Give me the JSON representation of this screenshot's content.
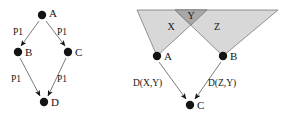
{
  "figure": {
    "background_color": "#ffffff",
    "ink_color": "#141414",
    "edge_stroke_color": "#6b6b6b",
    "region_fill_light": "#d8d8d8",
    "region_fill_dark": "#a8a8a8",
    "region_stroke": "#7a7a7a"
  },
  "left_diagram": {
    "name": "diamond-dependency-graph",
    "nodes": [
      {
        "id": "A",
        "label": "A",
        "x": 42,
        "y": 15,
        "label_x": 50,
        "label_y": 14
      },
      {
        "id": "B",
        "label": "B",
        "x": 18,
        "y": 52,
        "label_x": 26,
        "label_y": 52
      },
      {
        "id": "C",
        "label": "C",
        "x": 68,
        "y": 52,
        "label_x": 76,
        "label_y": 52
      },
      {
        "id": "D",
        "label": "D",
        "x": 44,
        "y": 102,
        "label_x": 52,
        "label_y": 102
      }
    ],
    "edges": [
      {
        "from": "A",
        "to": "B",
        "label": "P1",
        "label_x": 18,
        "label_y": 33
      },
      {
        "from": "A",
        "to": "C",
        "label": "P1",
        "label_x": 59,
        "label_y": 33
      },
      {
        "from": "B",
        "to": "D",
        "label": "P1",
        "label_x": 15,
        "label_y": 80
      },
      {
        "from": "C",
        "to": "D",
        "label": "P1",
        "label_x": 59,
        "label_y": 80
      }
    ]
  },
  "right_diagram": {
    "name": "overlapping-regions-graph",
    "regions": [
      {
        "id": "X",
        "label": "X",
        "shade": "light",
        "label_x": 171,
        "label_y": 28
      },
      {
        "id": "Y",
        "label": "Y",
        "shade": "dark",
        "label_x": 190,
        "label_y": 19
      },
      {
        "id": "Z",
        "label": "Z",
        "shade": "light",
        "label_x": 217,
        "label_y": 28
      }
    ],
    "nodes": [
      {
        "id": "A",
        "label": "A",
        "x": 157,
        "y": 56,
        "label_x": 165,
        "label_y": 56
      },
      {
        "id": "B",
        "label": "B",
        "x": 223,
        "y": 56,
        "label_x": 231,
        "label_y": 56
      },
      {
        "id": "C",
        "label": "C",
        "x": 190,
        "y": 105,
        "label_x": 198,
        "label_y": 105
      }
    ],
    "edges": [
      {
        "from": "A",
        "to": "C",
        "label": "D(X,Y)",
        "label_x": 134,
        "label_y": 84
      },
      {
        "from": "B",
        "to": "C",
        "label": "D(Z,Y)",
        "label_x": 209,
        "label_y": 84
      }
    ]
  }
}
